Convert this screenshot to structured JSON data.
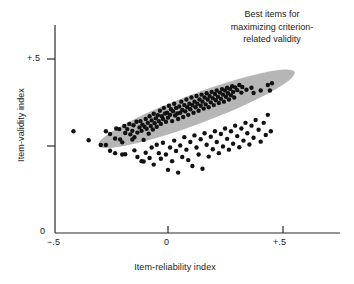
{
  "chart_data": {
    "type": "scatter",
    "title": "",
    "xlabel": "Item-reliability index",
    "ylabel": "Item-validity index",
    "xlim": [
      -0.5,
      0.5
    ],
    "ylim": [
      0.0,
      0.5
    ],
    "xticks": [
      -0.5,
      0.0,
      0.5
    ],
    "xticklabels": [
      "−.5",
      "0",
      "+.5"
    ],
    "yticks": [
      0.0,
      0.25,
      0.5
    ],
    "yticklabels": [
      "0",
      "",
      "+.5"
    ],
    "grid": false,
    "legend": null,
    "marker": "filled-circle",
    "marker_color": "#111111",
    "marker_size_px": 3.2,
    "annotations": [
      {
        "name": "best-items-callout",
        "text": "Best items for maximizing criterion-related validity",
        "line1": "Best items for",
        "line2": "maximizing criterion-",
        "line3": "related validity"
      }
    ],
    "highlight_region": {
      "name": "best-items-ellipse",
      "shape": "ellipse",
      "fill": "#b6b6b6",
      "center": [
        0.124,
        0.357
      ],
      "semi_major": 0.455,
      "semi_minor": 0.043,
      "rotation_deg": -20.5
    },
    "points": [
      [
        -0.411,
        0.2925
      ],
      [
        -0.345,
        0.2665
      ],
      [
        -0.292,
        0.253
      ],
      [
        -0.27,
        0.253
      ],
      [
        -0.27,
        0.2925
      ],
      [
        -0.252,
        0.2845
      ],
      [
        -0.23,
        0.2715
      ],
      [
        -0.225,
        0.3005
      ],
      [
        -0.212,
        0.2985
      ],
      [
        -0.208,
        0.269
      ],
      [
        -0.199,
        0.2605
      ],
      [
        -0.19,
        0.3075
      ],
      [
        -0.186,
        0.2875
      ],
      [
        -0.177,
        0.2985
      ],
      [
        -0.168,
        0.3135
      ],
      [
        -0.164,
        0.2835
      ],
      [
        -0.155,
        0.2935
      ],
      [
        -0.15,
        0.3095
      ],
      [
        -0.146,
        0.2755
      ],
      [
        -0.137,
        0.3195
      ],
      [
        -0.133,
        0.2885
      ],
      [
        -0.124,
        0.3035
      ],
      [
        -0.12,
        0.3215
      ],
      [
        -0.115,
        0.2935
      ],
      [
        -0.111,
        0.3115
      ],
      [
        -0.106,
        0.2675
      ],
      [
        -0.102,
        0.3055
      ],
      [
        -0.097,
        0.3275
      ],
      [
        -0.093,
        0.2995
      ],
      [
        -0.088,
        0.3165
      ],
      [
        -0.084,
        0.2855
      ],
      [
        -0.08,
        0.3355
      ],
      [
        -0.075,
        0.3075
      ],
      [
        -0.071,
        0.3235
      ],
      [
        -0.066,
        0.2975
      ],
      [
        -0.062,
        0.3425
      ],
      [
        -0.058,
        0.3155
      ],
      [
        -0.053,
        0.3295
      ],
      [
        -0.049,
        0.3055
      ],
      [
        -0.044,
        0.3385
      ],
      [
        -0.04,
        0.3215
      ],
      [
        -0.035,
        0.3515
      ],
      [
        -0.031,
        0.3135
      ],
      [
        -0.027,
        0.3355
      ],
      [
        -0.022,
        0.3275
      ],
      [
        -0.018,
        0.3595
      ],
      [
        -0.013,
        0.3435
      ],
      [
        -0.009,
        0.3195
      ],
      [
        -0.004,
        0.3455
      ],
      [
        0.0,
        0.3315
      ],
      [
        0.004,
        0.3655
      ],
      [
        0.009,
        0.3395
      ],
      [
        0.013,
        0.3555
      ],
      [
        0.018,
        0.3215
      ],
      [
        0.022,
        0.3495
      ],
      [
        0.027,
        0.3715
      ],
      [
        0.031,
        0.3375
      ],
      [
        0.035,
        0.3595
      ],
      [
        0.04,
        0.3435
      ],
      [
        0.044,
        0.3275
      ],
      [
        0.049,
        0.3635
      ],
      [
        0.053,
        0.3455
      ],
      [
        0.058,
        0.3775
      ],
      [
        0.062,
        0.3535
      ],
      [
        0.066,
        0.3335
      ],
      [
        0.071,
        0.3675
      ],
      [
        0.075,
        0.3495
      ],
      [
        0.08,
        0.3835
      ],
      [
        0.084,
        0.3615
      ],
      [
        0.088,
        0.3395
      ],
      [
        0.093,
        0.3715
      ],
      [
        0.097,
        0.3555
      ],
      [
        0.102,
        0.3895
      ],
      [
        0.106,
        0.3675
      ],
      [
        0.111,
        0.3455
      ],
      [
        0.115,
        0.3775
      ],
      [
        0.12,
        0.3615
      ],
      [
        0.124,
        0.3935
      ],
      [
        0.128,
        0.3715
      ],
      [
        0.133,
        0.3515
      ],
      [
        0.137,
        0.3835
      ],
      [
        0.142,
        0.3655
      ],
      [
        0.146,
        0.3975
      ],
      [
        0.15,
        0.3775
      ],
      [
        0.155,
        0.3575
      ],
      [
        0.159,
        0.3895
      ],
      [
        0.164,
        0.3695
      ],
      [
        0.168,
        0.4015
      ],
      [
        0.173,
        0.3835
      ],
      [
        0.177,
        0.3615
      ],
      [
        0.181,
        0.3935
      ],
      [
        0.186,
        0.3755
      ],
      [
        0.19,
        0.4055
      ],
      [
        0.195,
        0.3875
      ],
      [
        0.199,
        0.3675
      ],
      [
        0.204,
        0.3995
      ],
      [
        0.208,
        0.3815
      ],
      [
        0.212,
        0.4095
      ],
      [
        0.217,
        0.3915
      ],
      [
        0.221,
        0.3735
      ],
      [
        0.226,
        0.4035
      ],
      [
        0.23,
        0.3855
      ],
      [
        0.235,
        0.4135
      ],
      [
        0.239,
        0.3975
      ],
      [
        0.243,
        0.3775
      ],
      [
        0.248,
        0.4095
      ],
      [
        0.252,
        0.3915
      ],
      [
        0.257,
        0.4175
      ],
      [
        0.261,
        0.4015
      ],
      [
        0.265,
        0.3835
      ],
      [
        0.27,
        0.4135
      ],
      [
        0.274,
        0.3955
      ],
      [
        0.279,
        0.4215
      ],
      [
        0.283,
        0.4055
      ],
      [
        0.288,
        0.3895
      ],
      [
        0.292,
        0.4185
      ],
      [
        0.301,
        0.4105
      ],
      [
        0.31,
        0.4255
      ],
      [
        0.319,
        0.4035
      ],
      [
        0.323,
        0.4195
      ],
      [
        0.341,
        0.4115
      ],
      [
        0.363,
        0.4175
      ],
      [
        0.372,
        0.4025
      ],
      [
        0.403,
        0.4095
      ],
      [
        0.434,
        0.4255
      ],
      [
        0.443,
        0.4095
      ],
      [
        0.452,
        0.4305
      ],
      [
        -0.252,
        0.2365
      ],
      [
        -0.23,
        0.2295
      ],
      [
        -0.199,
        0.2255
      ],
      [
        -0.186,
        0.2265
      ],
      [
        -0.155,
        0.2685
      ],
      [
        -0.146,
        0.2375
      ],
      [
        -0.133,
        0.2185
      ],
      [
        -0.115,
        0.2065
      ],
      [
        -0.106,
        0.2055
      ],
      [
        -0.097,
        0.2305
      ],
      [
        -0.08,
        0.2155
      ],
      [
        -0.071,
        0.2455
      ],
      [
        -0.062,
        0.1965
      ],
      [
        -0.049,
        0.2535
      ],
      [
        -0.04,
        0.2295
      ],
      [
        -0.031,
        0.2135
      ],
      [
        -0.022,
        0.2595
      ],
      [
        -0.009,
        0.2255
      ],
      [
        0.0,
        0.1815
      ],
      [
        0.009,
        0.2455
      ],
      [
        0.018,
        0.2065
      ],
      [
        0.027,
        0.2655
      ],
      [
        0.035,
        0.2355
      ],
      [
        0.044,
        0.1735
      ],
      [
        0.053,
        0.2515
      ],
      [
        0.062,
        0.2185
      ],
      [
        0.071,
        0.2755
      ],
      [
        0.08,
        0.2395
      ],
      [
        0.088,
        0.2095
      ],
      [
        0.097,
        0.2615
      ],
      [
        0.106,
        0.1925
      ],
      [
        0.115,
        0.2805
      ],
      [
        0.124,
        0.2455
      ],
      [
        0.133,
        0.2255
      ],
      [
        0.142,
        0.2695
      ],
      [
        0.15,
        0.1845
      ],
      [
        0.159,
        0.2865
      ],
      [
        0.168,
        0.2535
      ],
      [
        0.177,
        0.2195
      ],
      [
        0.186,
        0.2765
      ],
      [
        0.195,
        0.2405
      ],
      [
        0.204,
        0.2925
      ],
      [
        0.212,
        0.2615
      ],
      [
        0.221,
        0.2295
      ],
      [
        0.23,
        0.2845
      ],
      [
        0.239,
        0.2485
      ],
      [
        0.248,
        0.3005
      ],
      [
        0.257,
        0.2705
      ],
      [
        0.265,
        0.2395
      ],
      [
        0.274,
        0.2925
      ],
      [
        0.283,
        0.2565
      ],
      [
        0.292,
        0.3085
      ],
      [
        0.301,
        0.2785
      ],
      [
        0.31,
        0.2465
      ],
      [
        0.319,
        0.3005
      ],
      [
        0.328,
        0.2655
      ],
      [
        0.337,
        0.3165
      ],
      [
        0.345,
        0.2865
      ],
      [
        0.354,
        0.2545
      ],
      [
        0.363,
        0.3085
      ],
      [
        0.372,
        0.2735
      ],
      [
        0.381,
        0.3245
      ],
      [
        0.394,
        0.2965
      ],
      [
        0.403,
        0.2625
      ],
      [
        0.416,
        0.3165
      ],
      [
        0.425,
        0.2815
      ],
      [
        0.434,
        0.3395
      ],
      [
        0.447,
        0.2925
      ]
    ]
  }
}
